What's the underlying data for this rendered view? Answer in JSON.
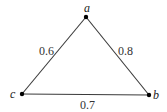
{
  "graph": {
    "nodes": [
      {
        "id": "a",
        "label": "a",
        "x": 86,
        "y": 17,
        "lx": 86,
        "ly": 12
      },
      {
        "id": "b",
        "label": "b",
        "x": 149,
        "y": 95,
        "lx": 153,
        "ly": 99
      },
      {
        "id": "c",
        "label": "c",
        "x": 22,
        "y": 94,
        "lx": 10,
        "ly": 98
      }
    ],
    "edges": [
      {
        "from": "a",
        "to": "c",
        "weight": "0.6",
        "lx": 40,
        "ly": 55
      },
      {
        "from": "a",
        "to": "b",
        "weight": "0.8",
        "lx": 118,
        "ly": 55
      },
      {
        "from": "c",
        "to": "b",
        "weight": "0.7",
        "lx": 80,
        "ly": 108
      }
    ]
  }
}
